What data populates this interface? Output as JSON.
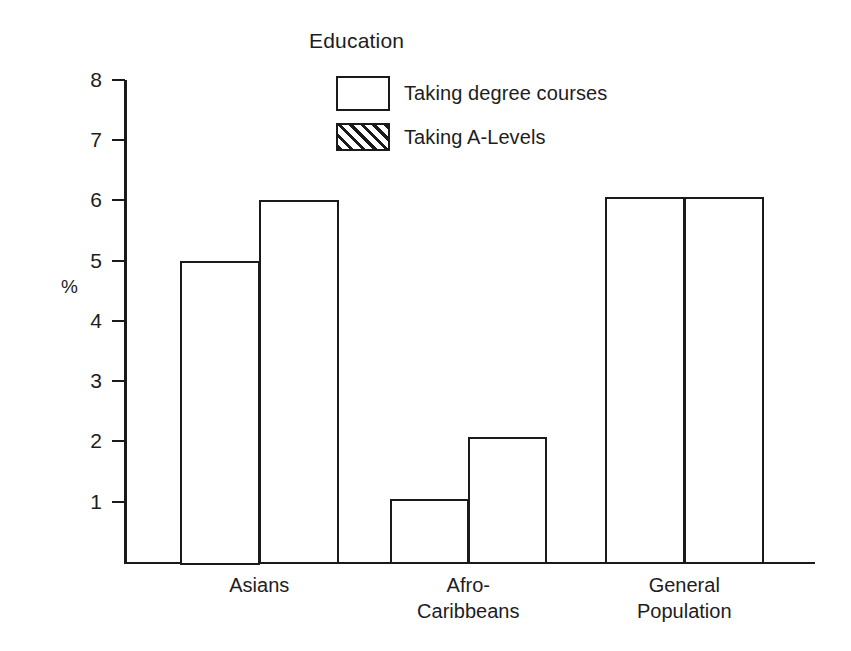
{
  "chart_data": {
    "type": "bar",
    "title": "Education",
    "xlabel": "",
    "ylabel": "%",
    "ylim": [
      0,
      8
    ],
    "yticks": [
      1,
      2,
      3,
      4,
      5,
      6,
      7,
      8
    ],
    "grid": false,
    "legend_position": "top-center",
    "categories": [
      "Asians",
      "Afro-\nCaribbeans",
      "General\nPopulation"
    ],
    "series": [
      {
        "name": "Taking degree courses",
        "style": "outline",
        "values": [
          5.0,
          1.05,
          6.05
        ]
      },
      {
        "name": "Taking A-Levels",
        "style": "hatched",
        "values": [
          6.0,
          2.08,
          6.05
        ]
      }
    ]
  },
  "colors": {
    "ink": "#1a1a1a",
    "background": "#ffffff"
  },
  "axis": {
    "unit_label": "%",
    "tick_labels": [
      "8",
      "7",
      "6",
      "5",
      "4",
      "3",
      "2",
      "1"
    ]
  },
  "legend": {
    "items": [
      {
        "label": "Taking degree courses",
        "swatch": "outline-box-icon"
      },
      {
        "label": "Taking A-Levels",
        "swatch": "hatched-box-icon"
      }
    ]
  },
  "categories_display": [
    {
      "line1": "Asians",
      "line2": ""
    },
    {
      "line1": "Afro-",
      "line2": "Caribbeans"
    },
    {
      "line1": "General",
      "line2": "Population"
    }
  ]
}
